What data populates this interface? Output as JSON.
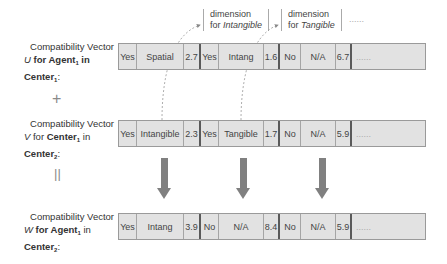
{
  "annotations": [
    {
      "line1": "dimension",
      "line2_prefix": "for ",
      "line2_italic": "Intangible"
    },
    {
      "line1": "dimension",
      "line2_prefix": "for ",
      "line2_italic": "Tangible"
    }
  ],
  "annotation_ellipsis": "......",
  "vectors": [
    {
      "label": {
        "line1": "Compatibility Vector",
        "var": "U",
        "for": " for ",
        "entity": "Agent",
        "entity_sub": "1",
        "in": " in",
        "center": "Center",
        "center_sub": "1",
        "colon": ":"
      },
      "cells": [
        "Yes",
        "Spatial",
        "2.7",
        "Yes",
        "Intang",
        "1.6",
        "No",
        "N/A",
        "6.7",
        "......"
      ]
    },
    {
      "label": {
        "line1": "Compatibility Vector",
        "var": "V",
        "for": " for ",
        "entity": "Center",
        "entity_sub": "1",
        "in": " in",
        "center": "Center",
        "center_sub": "2",
        "colon": ":"
      },
      "cells": [
        "Yes",
        "Intangible",
        "2.3",
        "Yes",
        "Tangible",
        "1.7",
        "No",
        "N/A",
        "5.9",
        "......"
      ]
    },
    {
      "label": {
        "line1": "Compatibility Vector",
        "var": "W",
        "for": " for ",
        "entity": "Agent",
        "entity_sub": "1",
        "in": " in",
        "center": "Center",
        "center_sub": "2",
        "colon": ":"
      },
      "cells": [
        "Yes",
        "Intang",
        "3.9",
        "No",
        "N/A",
        "8.4",
        "No",
        "N/A",
        "5.9",
        "......"
      ]
    }
  ],
  "operators": {
    "plus": "+",
    "equals": "||"
  },
  "colors": {
    "cell_bg": "#e2e2e2",
    "arrow": "#808080",
    "separator": "#5a5a5a"
  }
}
